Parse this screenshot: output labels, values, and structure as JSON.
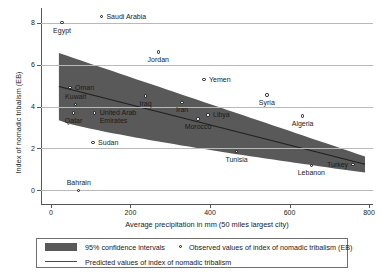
{
  "chart_data": {
    "type": "scatter",
    "title": "",
    "xlabel": "Average precipitation in mm (50 miles largest city)",
    "ylabel": "Index of nomadic tribalism (EB)",
    "xlim": [
      -25,
      810
    ],
    "ylim": [
      -0.55,
      8.6
    ],
    "xticks": [
      0,
      200,
      400,
      600,
      800
    ],
    "yticks": [
      0,
      2,
      4,
      6,
      8
    ],
    "xtick_labels": [
      "0",
      "200",
      "400",
      "600",
      "800"
    ],
    "ytick_labels": [
      "0",
      "2",
      "4",
      "6",
      "8"
    ],
    "grid": "horizontal",
    "points": [
      {
        "name": "Saudi Arabia",
        "x": 127,
        "y": 8.3,
        "label_side": "right"
      },
      {
        "name": "Egypt",
        "x": 28,
        "y": 8.0,
        "label_side": "below"
      },
      {
        "name": "Jordan",
        "x": 270,
        "y": 6.6,
        "label_side": "below"
      },
      {
        "name": "Yemen",
        "x": 385,
        "y": 5.3,
        "label_side": "right"
      },
      {
        "name": "Oman",
        "x": 48,
        "y": 4.9,
        "label_side": "right"
      },
      {
        "name": "Syria",
        "x": 543,
        "y": 4.55,
        "label_side": "below"
      },
      {
        "name": "Iraq",
        "x": 238,
        "y": 4.5,
        "label_side": "below"
      },
      {
        "name": "Iran",
        "x": 330,
        "y": 4.2,
        "label_side": "below"
      },
      {
        "name": "Kuwait",
        "x": 62,
        "y": 4.1,
        "label_side": "above"
      },
      {
        "name": "Qatar",
        "x": 57,
        "y": 3.7,
        "label_side": "below"
      },
      {
        "name": "United Arab Emirates",
        "x": 110,
        "y": 3.7,
        "label_side": "right"
      },
      {
        "name": "Libya",
        "x": 395,
        "y": 3.6,
        "label_side": "right"
      },
      {
        "name": "Algeria",
        "x": 633,
        "y": 3.55,
        "label_side": "below"
      },
      {
        "name": "Morocco",
        "x": 370,
        "y": 3.4,
        "label_side": "below"
      },
      {
        "name": "Sudan",
        "x": 106,
        "y": 2.3,
        "label_side": "right"
      },
      {
        "name": "Tunisia",
        "x": 467,
        "y": 1.85,
        "label_side": "below"
      },
      {
        "name": "Turkey",
        "x": 760,
        "y": 1.25,
        "label_side": "left"
      },
      {
        "name": "Lebanon",
        "x": 655,
        "y": 1.2,
        "label_side": "below"
      },
      {
        "name": "Bahrain",
        "x": 70,
        "y": 0.0,
        "label_side": "above"
      }
    ],
    "fit_line": {
      "x_start": 20,
      "y_start": 4.95,
      "x_end": 790,
      "y_end": 1.25
    },
    "confidence_band": {
      "level": "95%",
      "x_start": 20,
      "x_end": 790,
      "upper_start": 6.55,
      "upper_end": 1.62,
      "lower_start": 3.35,
      "lower_end": 0.85
    }
  },
  "legend": {
    "band_label": "95% confidence intervals",
    "points_label": "Observed values of index of nomadic tribalism (EB)",
    "line_label": "Predicted values of index of nomadic tribalism"
  },
  "colors": {
    "band": "#595959",
    "line": "#4a4a4a",
    "grid": "#b9b9b9",
    "axis": "#555555",
    "marker_edge": "#111111",
    "text": "#1a1a1a"
  }
}
